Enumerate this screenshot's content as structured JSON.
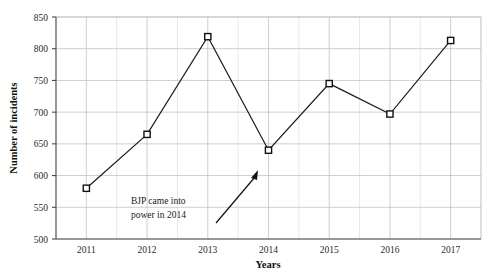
{
  "chart_data": {
    "type": "line",
    "title": "",
    "xlabel": "Years",
    "ylabel": "Number of incidents",
    "categories": [
      "2011",
      "2012",
      "2013",
      "2014",
      "2015",
      "2016",
      "2017"
    ],
    "values": [
      580,
      665,
      819,
      640,
      745,
      697,
      813
    ],
    "series": [
      {
        "name": "Number of incidents",
        "values": [
          580,
          665,
          819,
          640,
          745,
          697,
          813
        ]
      }
    ],
    "ylim": [
      500,
      850
    ],
    "yticks": [
      "500",
      "550",
      "600",
      "650",
      "700",
      "750",
      "800",
      "850"
    ],
    "ytick_values": [
      500,
      550,
      600,
      650,
      700,
      750,
      800,
      850
    ],
    "xlim": [
      "2011",
      "2017"
    ],
    "grid": true,
    "minor_grid": true,
    "legend": "none",
    "marker": "open-square",
    "line_color": "#1c1c1c",
    "marker_fill": "#ffffff",
    "grid_color": "#b9b9b9",
    "background": "#ffffff",
    "annotations": [
      {
        "text_line1": "BJP came into",
        "text_line2": "power in 2014",
        "points_to_category": "2014",
        "arrow": "up-right"
      }
    ]
  },
  "axis": {
    "y_title": "Number of incidents",
    "x_title": "Years"
  },
  "annotation": {
    "line1": "BJP came into",
    "line2": "power in 2014"
  }
}
